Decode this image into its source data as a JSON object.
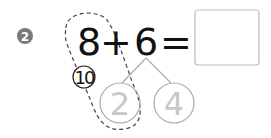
{
  "problem": {
    "number_badge": "2",
    "left_operand": "8",
    "operator": "+",
    "right_operand": "6",
    "equals": "=",
    "answer": "",
    "make_ten_hint": "10",
    "decomposition": {
      "left_part": "2",
      "right_part": "4"
    }
  },
  "colors": {
    "badge_fill": "#7a7a7a",
    "badge_text": "#ffffff",
    "main_text": "#111111",
    "hint_text": "#c8c8c8",
    "circle_stroke": "#aaaaaa",
    "box_stroke": "#bdbdbd",
    "dashed_stroke": "#444444"
  }
}
